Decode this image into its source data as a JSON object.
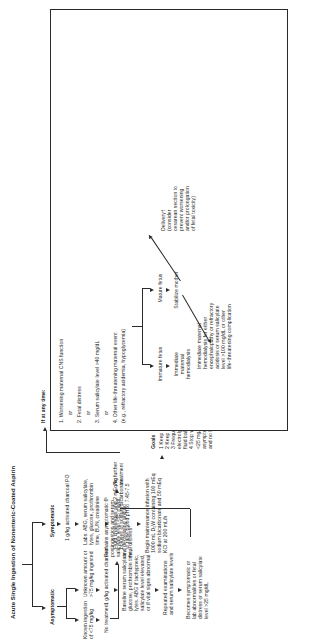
{
  "chart": {
    "title": "Acute Single Ingestion of Nonenteric-Coated Aspirin",
    "branch_asymptomatic": "Asymptomatic",
    "branch_symptomatic": "Symptomatic",
    "asym": {
      "known_low": "Known ingestion\nof <75 mg/kg",
      "unknown_high": "Unknown amount or\n>75 mg/kg ingested",
      "no_treatment": "No treatment",
      "charcoal": "1 g/kg activated charcoal",
      "baseline_labs": "Baseline serum salicylate,\nglucose, prothrombin time,\nlytes. ABG if tachypneic,\nsalicylate level elevated,\nor if vital signs abnormal",
      "remains_asym": "Remains asymptomatic 6ʰ\npostingestion and serum\nsalicylate level <25 mg/dL\nand decreasing and no\nfetal distress*",
      "repeated_exams": "Repeated examinations\nand serum salicylate levels",
      "no_further": "No further\ntreatment",
      "becomes_sym": "Becomes symptomatic or\nlab abnormalities or fetal\ndistress or serum salicylate\nlevel >25 mg/dL"
    },
    "sym": {
      "charcoal_po": "1 g/kg activated charcoal PO",
      "labs": "Labs: ABG, serum salicylate,\nlytes, glucose, prothrombin\ntime, BUN, creatinine",
      "fluid_challenges": "Fluid challenges and 2 mEq/kg\nboluses of sodium bicarbonate\nto raise blood pH to 7.45-7.5",
      "maintenance": "Begin maintenance infusion with\n1000 mL D₅W containing 100 mEq\nsodium bicarbonate and 50 mEq\nKCl at 200 mL/h",
      "goals_title": "Goals",
      "goals": [
        "1 Keep blood pH 7.45-7.5",
        "2 Keep urine pH >7",
        "3 Frequently monitor and correct",
        "   electrolyte, acid/base, and",
        "   fluid balance",
        "4 Stop when serum salicylate level",
        "   <25 mg/dL and falling and patient",
        "   asymptomatic without acidosis",
        "   and no fetal distress"
      ]
    },
    "anytime": {
      "header": "If at any time:",
      "criteria": [
        "1. Worsening maternal CNS function",
        "2. Fetal distress",
        "3. Serum salicylate level >40 mg/dL",
        "4. Other life-threatening maternal event",
        "    (e.g., refractory acidemia, hypoglycemia)"
      ],
      "or": "or",
      "immature_fetus": "Immature fetus",
      "mature_fetus": "Mature fetus",
      "immediate_hemo": "Immediate\nmaternal\nhemodialysis",
      "stabilize_mother": "Stabilize mother",
      "hemo_detail": "Immediate maternal\nhemodialysis for either\nencephalopathy or refractory\nacidosis or serum salicylate\nlevel >100 mg/dL or other\nlife-threatening complication",
      "delivery": "Delivery†\n(consider\ncesarean section to\nprevent worsening\nand/or prolongation\nof fetal toxicity)"
    }
  }
}
